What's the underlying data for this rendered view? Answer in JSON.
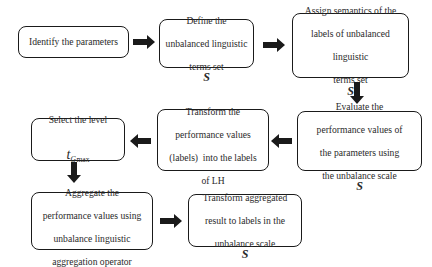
{
  "diagram": {
    "type": "flowchart",
    "nodes": [
      {
        "id": "n1",
        "label": "Identify the parameters"
      },
      {
        "id": "n2",
        "label_lines": [
          "Define the",
          "unbalanced linguistic",
          "terms set"
        ],
        "symbol": "S"
      },
      {
        "id": "n3",
        "label_lines": [
          "Assign semantics of the",
          "labels of unbalanced",
          "linguistic",
          "terms set"
        ],
        "symbol": "S"
      },
      {
        "id": "n4",
        "label_lines": [
          "Evaluate the",
          "performance values of",
          "the parameters using",
          "the unbalance scale"
        ],
        "symbol": "S"
      },
      {
        "id": "n5",
        "label_lines": [
          "Transform the",
          "performance values",
          "(labels)  into the labels",
          "of LH"
        ]
      },
      {
        "id": "n6",
        "label_lines": [
          "Select the level"
        ],
        "math": {
          "base": "t",
          "sub": "G",
          "sub_suffix": "max"
        }
      },
      {
        "id": "n7",
        "label_lines": [
          "Aggregate the",
          "performance values using",
          "unbalance linguistic",
          "aggregation operator"
        ]
      },
      {
        "id": "n8",
        "label_lines": [
          "Transform aggregated",
          "result to labels in the",
          "unbalance scale"
        ],
        "symbol": "S"
      }
    ],
    "edges": [
      {
        "from": "n1",
        "to": "n2",
        "direction": "right"
      },
      {
        "from": "n2",
        "to": "n3",
        "direction": "right"
      },
      {
        "from": "n3",
        "to": "n4",
        "direction": "down"
      },
      {
        "from": "n4",
        "to": "n5",
        "direction": "left"
      },
      {
        "from": "n5",
        "to": "n6",
        "direction": "left"
      },
      {
        "from": "n6",
        "to": "n7",
        "direction": "down"
      },
      {
        "from": "n7",
        "to": "n8",
        "direction": "right"
      }
    ],
    "colors": {
      "border": "#1a1a1a",
      "arrow": "#1a1a1a",
      "text": "#2a2a2a",
      "background": "#ffffff"
    }
  }
}
